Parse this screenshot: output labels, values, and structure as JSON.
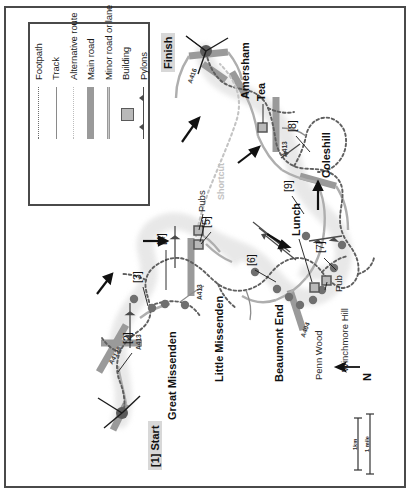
{
  "map": {
    "title_region": "Chiltern Hills walking route map",
    "orientation_note": "map content rotated 90 degrees",
    "north_arrow_label": "N",
    "scale_bars": [
      {
        "label": "1km"
      },
      {
        "label": "1 mile"
      }
    ]
  },
  "legend": {
    "items": [
      {
        "label": "Footpath",
        "icon": "dotted-line-dark-icon"
      },
      {
        "label": "Track",
        "icon": "solid-thin-line-icon"
      },
      {
        "label": "Alternative route",
        "icon": "dotted-line-light-icon"
      },
      {
        "label": "Main road",
        "icon": "thick-grey-bar-icon"
      },
      {
        "label": "Minor road or lane",
        "icon": "thin-double-line-icon"
      },
      {
        "label": "Building",
        "icon": "square-building-icon"
      },
      {
        "label": "Pylons",
        "icon": "pylon-line-icon"
      }
    ]
  },
  "waypoints": [
    {
      "id": "1",
      "text": "[1] Start",
      "highlighted": true
    },
    {
      "id": "2",
      "text": "[2]",
      "highlighted": false
    },
    {
      "id": "3",
      "text": "[3]",
      "highlighted": false
    },
    {
      "id": "4",
      "text": "[4]",
      "highlighted": false
    },
    {
      "id": "5",
      "text": "[5]",
      "highlighted": false
    },
    {
      "id": "6",
      "text": "[6]",
      "highlighted": false
    },
    {
      "id": "7",
      "text": "[7]",
      "highlighted": false
    },
    {
      "id": "8",
      "text": "[8]",
      "highlighted": false
    },
    {
      "id": "9",
      "text": "[9]",
      "highlighted": false
    }
  ],
  "markers": {
    "finish": "Finish",
    "tea": "Tea",
    "lunch": "Lunch",
    "pub": "Pub",
    "pubs": "Pubs",
    "shortcut": "Shortcut"
  },
  "places": [
    {
      "name": "Great Missenden",
      "style": "major"
    },
    {
      "name": "Little Missenden",
      "style": "major"
    },
    {
      "name": "Beaumont End",
      "style": "major"
    },
    {
      "name": "Amersham",
      "style": "major"
    },
    {
      "name": "Coleshill",
      "style": "major"
    },
    {
      "name": "Penn Wood",
      "style": "minor"
    },
    {
      "name": "Winchmore Hill",
      "style": "minor"
    }
  ],
  "roads": [
    {
      "ref": "A413",
      "instances": 3
    },
    {
      "ref": "A416",
      "instances": 1
    },
    {
      "ref": "A4128",
      "instances": 1
    },
    {
      "ref": "A404",
      "instances": 1
    }
  ],
  "colors": {
    "frame": "#4a4a4a",
    "main_road": "#9a9a9a",
    "minor_road": "#c9c9c9",
    "footpath": "#6e6e6e",
    "alt_route": "#c2c2c2",
    "woodland": "#6f6f6f",
    "highlight_box": "#d8d8d8",
    "building_fill": "#b9b9b9",
    "settlement_wash": "#e2e2e2",
    "background": "#ffffff"
  }
}
